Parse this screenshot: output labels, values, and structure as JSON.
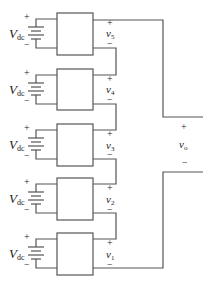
{
  "diagram": {
    "wire_color": "#555555",
    "cells": [
      {
        "source_label": "V",
        "source_sub": "dc",
        "output_label": "v",
        "output_sub": "5",
        "plus": "+",
        "minus": "−"
      },
      {
        "source_label": "V",
        "source_sub": "dc",
        "output_label": "v",
        "output_sub": "4",
        "plus": "+",
        "minus": "−"
      },
      {
        "source_label": "V",
        "source_sub": "dc",
        "output_label": "v",
        "output_sub": "3",
        "plus": "+",
        "minus": "−"
      },
      {
        "source_label": "V",
        "source_sub": "dc",
        "output_label": "v",
        "output_sub": "2",
        "plus": "+",
        "minus": "−"
      },
      {
        "source_label": "V",
        "source_sub": "dc",
        "output_label": "v",
        "output_sub": "1",
        "plus": "+",
        "minus": "−"
      }
    ],
    "output": {
      "label": "v",
      "sub": "o",
      "plus": "+",
      "minus": "−"
    }
  }
}
